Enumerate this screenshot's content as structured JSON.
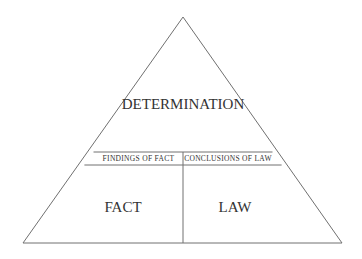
{
  "diagram": {
    "top_label": "DETERMINATION",
    "left_band_label": "FINDINGS OF FACT",
    "right_band_label": "CONCLUSIONS OF LAW",
    "bottom_left_label": "FACT",
    "bottom_right_label": "LAW",
    "line_color": "#707070",
    "text_color": "#333333"
  }
}
